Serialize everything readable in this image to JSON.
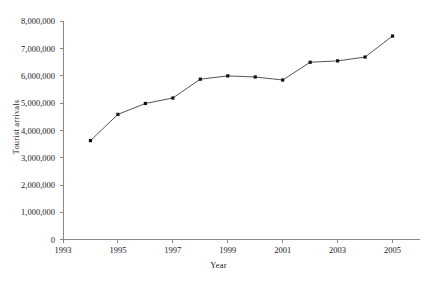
{
  "chart_data": {
    "type": "line",
    "title": "",
    "xlabel": "Year",
    "ylabel": "Tourist arrivals",
    "x": [
      1994,
      1995,
      1996,
      1997,
      1998,
      1999,
      2000,
      2001,
      2002,
      2003,
      2004,
      2005
    ],
    "values": [
      3630000,
      4590000,
      4990000,
      5190000,
      5880000,
      6000000,
      5960000,
      5850000,
      6500000,
      6550000,
      6690000,
      7460000
    ],
    "series": [
      {
        "name": "Tourist arrivals",
        "values": [
          3630000,
          4590000,
          4990000,
          5190000,
          5880000,
          6000000,
          5960000,
          5850000,
          6500000,
          6550000,
          6690000,
          7460000
        ]
      }
    ],
    "xlim": [
      1993,
      2006
    ],
    "ylim": [
      0,
      8000000
    ],
    "xticks": [
      1993,
      1995,
      1997,
      1999,
      2001,
      2003,
      2005
    ],
    "xtick_labels": [
      "1993",
      "1995",
      "1997",
      "1999",
      "2001",
      "2003",
      "2005"
    ],
    "yticks": [
      0,
      1000000,
      2000000,
      3000000,
      4000000,
      5000000,
      6000000,
      7000000,
      8000000
    ],
    "ytick_labels": [
      "0",
      "1,000,000",
      "2,000,000",
      "3,000,000",
      "4,000,000",
      "5,000,000",
      "6,000,000",
      "7,000,000",
      "8,000,000"
    ],
    "grid": false,
    "legend": false,
    "legend_position": "none",
    "marker": "square",
    "line_color": "#555555",
    "marker_color": "#111111",
    "axis_color": "#888888",
    "background_color": "#ffffff"
  }
}
